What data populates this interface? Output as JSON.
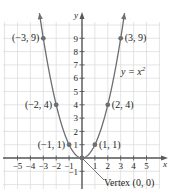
{
  "chart_data": {
    "type": "line",
    "title": "",
    "equation_label": "y = x",
    "equation_superscript": "2",
    "xlabel": "x",
    "ylabel": "y",
    "xlim": [
      -5.5,
      6
    ],
    "ylim": [
      -2.3,
      10.5
    ],
    "grid": true,
    "x_ticks": [
      -5,
      -4,
      -3,
      -2,
      -1,
      1,
      2,
      3,
      4,
      5
    ],
    "x_tick_labels": [
      "−5",
      "−4",
      "−3",
      "−2",
      "−1",
      "1",
      "2",
      "3",
      "4",
      "5"
    ],
    "y_ticks": [
      -1,
      1,
      2,
      3,
      4,
      5,
      6,
      7,
      8,
      9
    ],
    "y_tick_labels": [
      "−1",
      "1",
      "2",
      "3",
      "4",
      "5",
      "6",
      "7",
      "8",
      "9"
    ],
    "series": [
      {
        "name": "y = x^2",
        "function": "x^2",
        "x_range": [
          -3.3,
          3.3
        ]
      }
    ],
    "points": [
      {
        "x": -3,
        "y": 9,
        "label": "(−3, 9)"
      },
      {
        "x": -2,
        "y": 4,
        "label": "(−2, 4)"
      },
      {
        "x": -1,
        "y": 1,
        "label": "(−1, 1)"
      },
      {
        "x": 0,
        "y": 0,
        "label": "Vertex (0, 0)"
      },
      {
        "x": 1,
        "y": 1,
        "label": "(1, 1)"
      },
      {
        "x": 2,
        "y": 4,
        "label": "(2, 4)"
      },
      {
        "x": 3,
        "y": 9,
        "label": "(3, 9)"
      }
    ]
  },
  "colors": {
    "curve": "#6d6e71",
    "axis": "#58595b",
    "grid": "#d9dadb",
    "point": "#6d6e71",
    "text": "#231f20"
  }
}
